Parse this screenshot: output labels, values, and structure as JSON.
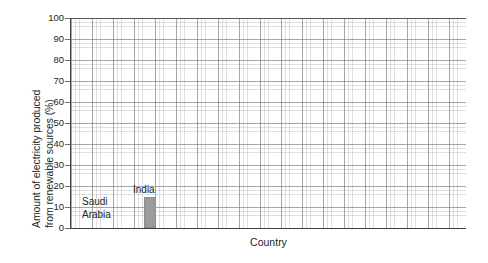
{
  "chart_data": {
    "type": "bar",
    "title": "",
    "xlabel": "Country",
    "ylabel": "Amount of electricity produced from renewable sources (%)",
    "ylabel_lines": [
      "Amount of electricity produced",
      "from renewable sources (%)"
    ],
    "categories": [
      "Saudi Arabia",
      "India"
    ],
    "values": [
      0,
      15
    ],
    "ylim": [
      0,
      100
    ],
    "ytick_values": [
      100,
      90,
      80,
      70,
      60,
      50,
      40,
      30,
      20,
      10,
      0
    ],
    "ytick_labels": [
      "100",
      "90",
      "80",
      "70",
      "60",
      "50",
      "40",
      "30",
      "20",
      "10",
      "0"
    ],
    "grid": true,
    "grid_major_step": 10,
    "grid_minor_per_major": 5,
    "legend": "none",
    "bar_color": "#9b9b9b",
    "axis_color": "#404042",
    "grid_color": "#787878",
    "background": "#ffffff",
    "bars": [
      {
        "category": "Saudi Arabia",
        "label_lines": [
          "Saudi",
          "Arabia"
        ],
        "value": 0,
        "label_x_px": 82,
        "label_y_px": 196,
        "bar_x_px": 0,
        "bar_width_px": 0
      },
      {
        "category": "India",
        "label_lines": [
          "India"
        ],
        "value": 15,
        "label_x_px": 133,
        "label_y_px": 184,
        "bar_x_px": 73,
        "bar_width_px": 12
      }
    ]
  }
}
